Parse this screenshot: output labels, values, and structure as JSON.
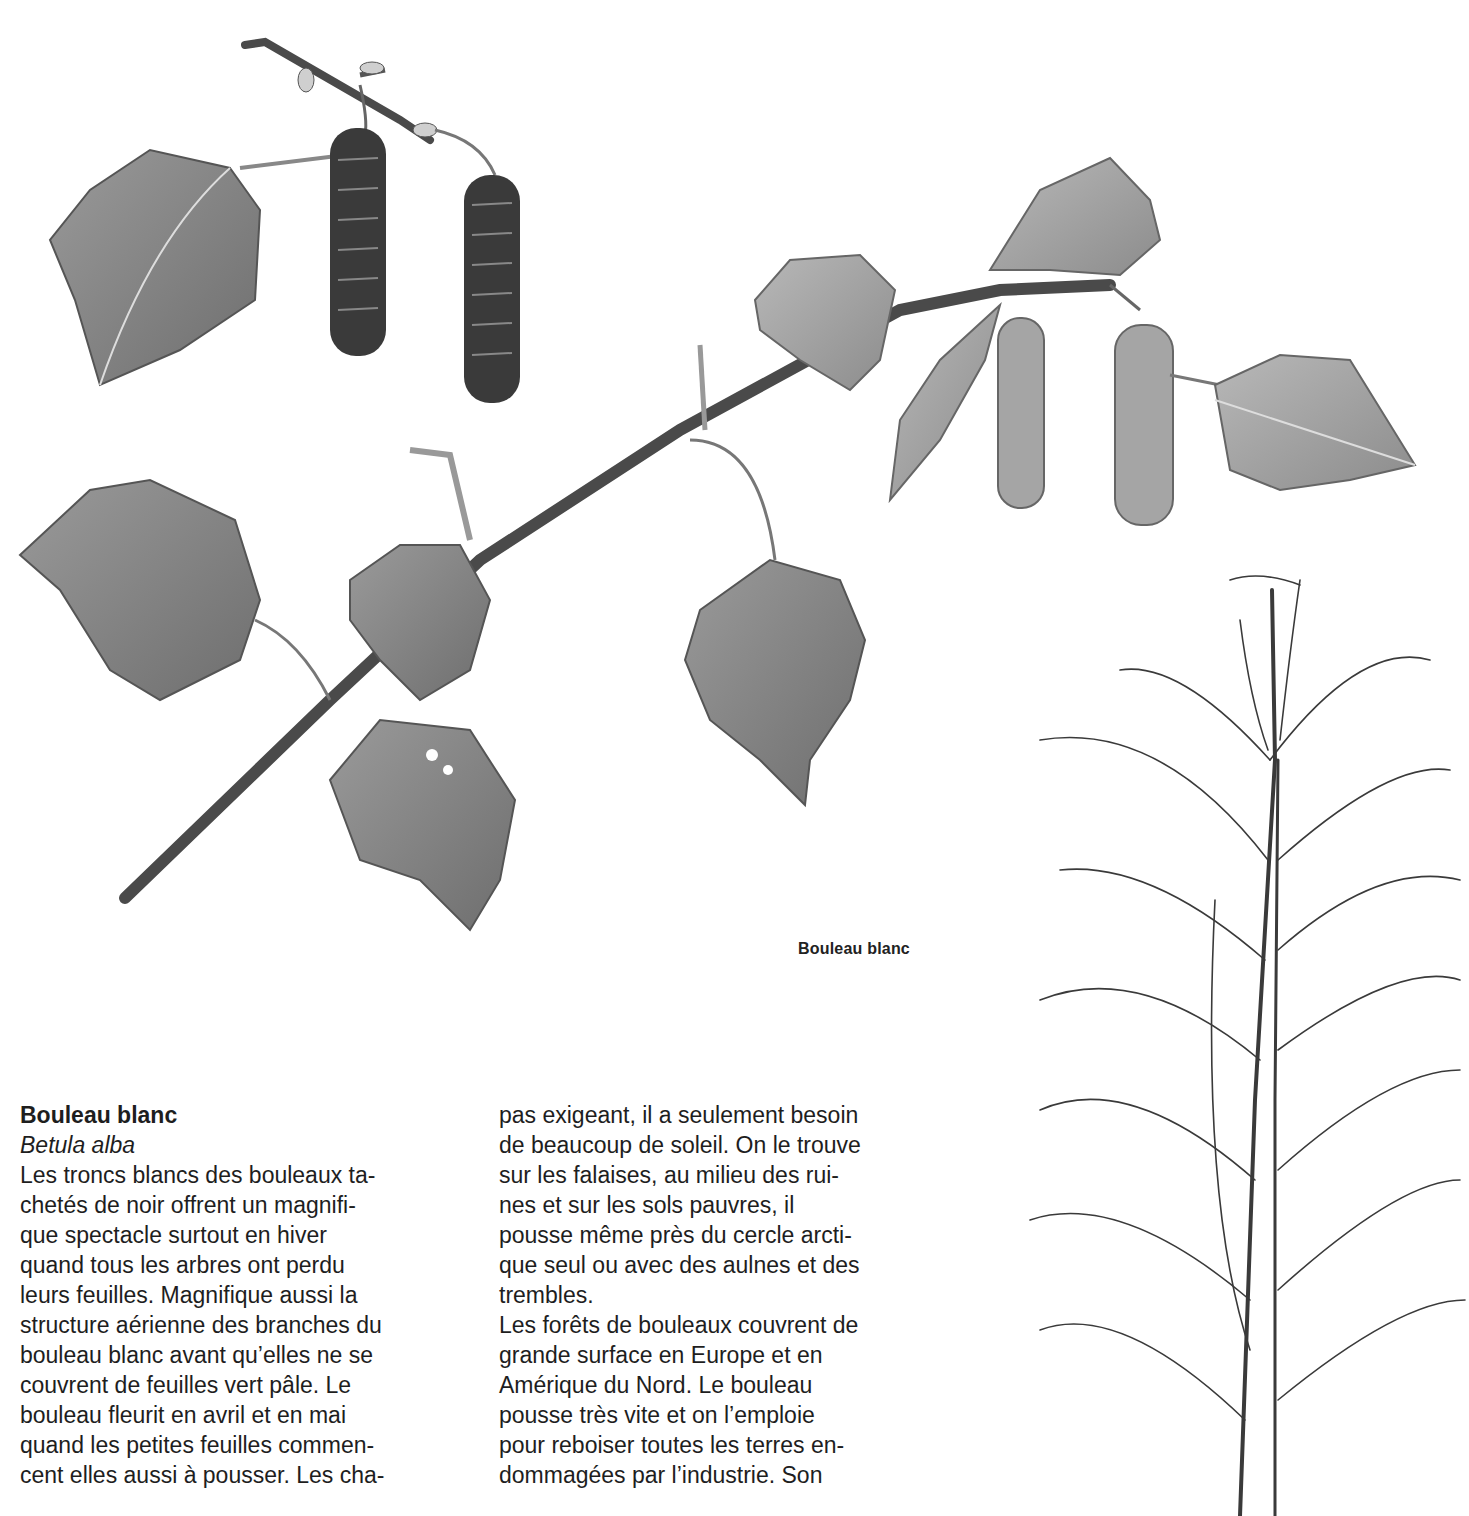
{
  "illustration": {
    "branch_caption": "Bouleau blanc",
    "icons": [
      "birch-branch-illustration",
      "birch-tree-illustration"
    ]
  },
  "article": {
    "title": "Bouleau blanc",
    "latin_name": "Betula alba",
    "column1_lines": [
      "Les troncs blancs des bouleaux ta-",
      "chetés de noir offrent un magnifi-",
      "que spectacle surtout en hiver",
      "quand tous les arbres ont perdu",
      "leurs feuilles. Magnifique aussi la",
      "structure aérienne des branches du",
      "bouleau blanc avant qu’elles ne se",
      "couvrent de feuilles vert pâle. Le",
      "bouleau fleurit en avril et en mai",
      "quand les petites feuilles commen-",
      "cent elles aussi à pousser. Les cha-"
    ],
    "column2_lines": [
      "pas exigeant, il a seulement besoin",
      "de beaucoup de soleil. On le trouve",
      "sur les falaises, au milieu des rui-",
      "nes et sur les sols pauvres, il",
      "pousse même près du cercle arcti-",
      "que seul ou avec des aulnes et des",
      "trembles.",
      "Les forêts de bouleaux couvrent de",
      "grande surface en Europe et en",
      "Amérique du Nord. Le bouleau",
      "pousse très vite et on l’emploie",
      "pour reboiser toutes les terres en-",
      "dommagées par l’industrie. Son"
    ]
  }
}
